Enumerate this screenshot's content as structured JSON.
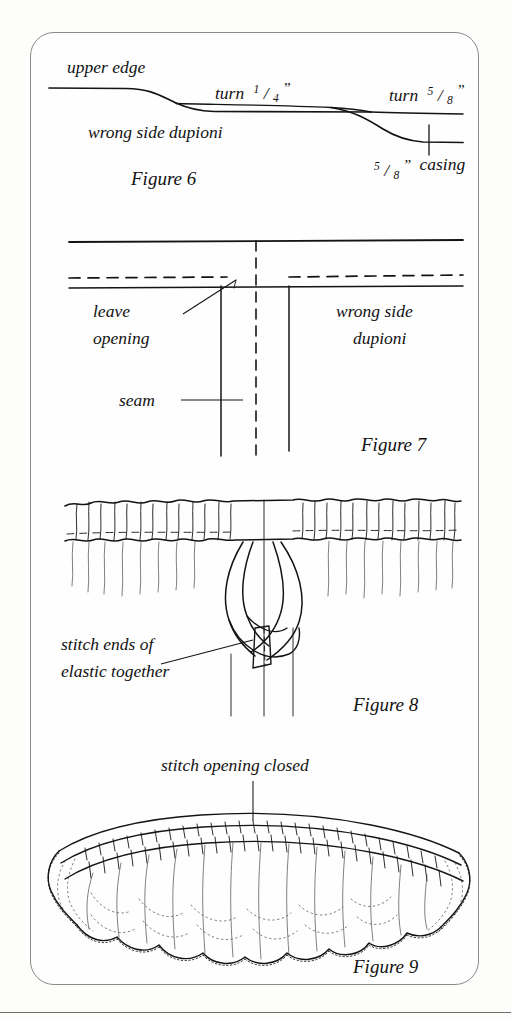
{
  "page": {
    "background_color": "#fdfdfc",
    "ink_color": "#141414",
    "card_border_color": "#8a8a8a"
  },
  "figures": [
    {
      "id": "figure-6",
      "caption": "Figure 6",
      "labels": {
        "upper_edge": "upper edge",
        "turn_quarter_prefix": "turn",
        "turn_quarter_numerator": "1",
        "turn_quarter_denominator": "4",
        "turn_quarter_unit": "”",
        "turn_five_eighths_prefix": "turn",
        "turn_five_eighths_numerator": "5",
        "turn_five_eighths_denominator": "8",
        "turn_five_eighths_unit": "”",
        "wrong_side": "wrong side dupioni",
        "casing_numerator": "5",
        "casing_denominator": "8",
        "casing_unit": "”",
        "casing_word": "casing"
      }
    },
    {
      "id": "figure-7",
      "caption": "Figure 7",
      "labels": {
        "leave": "leave",
        "opening": "opening",
        "wrong_side_line1": "wrong side",
        "wrong_side_line2": "dupioni",
        "seam": "seam"
      }
    },
    {
      "id": "figure-8",
      "caption": "Figure 8",
      "labels": {
        "stitch_ends_line1": "stitch ends of",
        "stitch_ends_line2": "elastic together"
      }
    },
    {
      "id": "figure-9",
      "caption": "Figure 9",
      "labels": {
        "stitch_opening_closed": "stitch opening closed"
      }
    }
  ]
}
